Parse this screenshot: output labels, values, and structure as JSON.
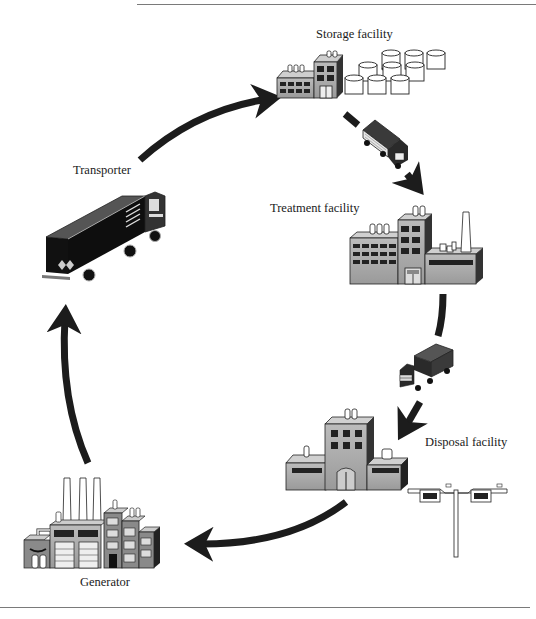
{
  "diagram": {
    "type": "cycle",
    "title": "",
    "nodes": [
      {
        "id": "generator",
        "label": "Generator",
        "icon": "factory-smokestacks-icon"
      },
      {
        "id": "transporter",
        "label": "Transporter",
        "icon": "semi-truck-icon"
      },
      {
        "id": "storage",
        "label": "Storage facility",
        "icon": "storage-tanks-building-icon"
      },
      {
        "id": "treatment",
        "label": "Treatment facility",
        "icon": "treatment-plant-icon"
      },
      {
        "id": "disposal",
        "label": "Disposal facility",
        "icon": "disposal-building-icon"
      }
    ],
    "edges": [
      {
        "from": "generator",
        "to": "transporter"
      },
      {
        "from": "transporter",
        "to": "storage"
      },
      {
        "from": "storage",
        "to": "treatment",
        "via_icon": "small-truck-icon"
      },
      {
        "from": "treatment",
        "to": "disposal",
        "via_icon": "small-truck-icon"
      },
      {
        "from": "disposal",
        "to": "generator"
      }
    ],
    "colors": {
      "arrow": "#1c1c1c",
      "building_fill": "#a9a9a9",
      "building_side": "#3a3a3a",
      "window": "#2a2a2a",
      "truck_body": "#151515"
    }
  }
}
